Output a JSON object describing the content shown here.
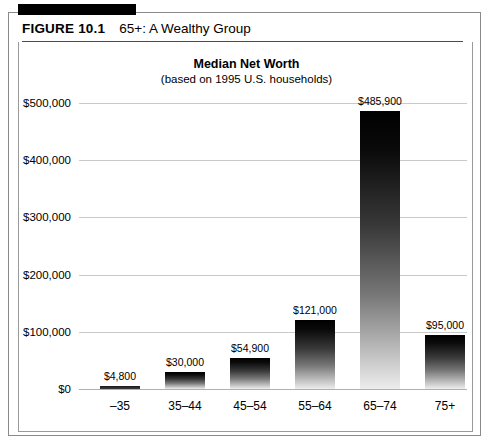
{
  "figure": {
    "number": "FIGURE 10.1",
    "title": "65+: A Wealthy Group"
  },
  "chart_data": {
    "type": "bar",
    "title": "Median Net Worth",
    "subtitle": "(based on 1995 U.S. households)",
    "xlabel": "",
    "ylabel": "",
    "ylim": [
      0,
      500000
    ],
    "grid": true,
    "legend": "none",
    "categories": [
      "–35",
      "35–44",
      "45–54",
      "55–64",
      "65–74",
      "75+"
    ],
    "values": [
      4800,
      30000,
      54900,
      121000,
      485900,
      95000
    ],
    "value_labels": [
      "$4,800",
      "$30,000",
      "$54,900",
      "$121,000",
      "$485,900",
      "$95,000"
    ],
    "ytick_values": [
      0,
      100000,
      200000,
      300000,
      400000,
      500000
    ],
    "ytick_labels": [
      "$0",
      "$100,000",
      "$200,000",
      "$300,000",
      "$400,000",
      "$500,000"
    ],
    "bar_style": "vertical gradient, black at top fading to light gray at bottom"
  },
  "colors": {
    "bar_top": "#000000",
    "bar_bottom": "#ededed",
    "gridline": "#c9c9c9",
    "border": "#8a8a8a",
    "rule": "#000000",
    "text": "#000000"
  }
}
